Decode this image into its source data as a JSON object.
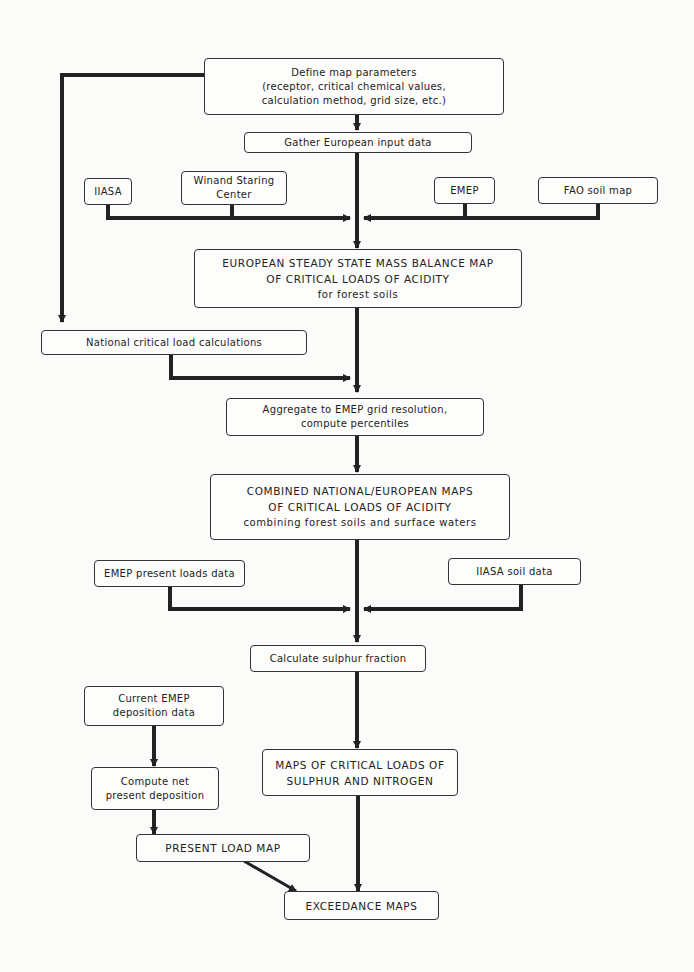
{
  "diagram": {
    "type": "flowchart",
    "nodes": {
      "define": {
        "lines": [
          "Define map parameters",
          "(receptor, critical chemical values,",
          "calculation method, grid size, etc.)"
        ]
      },
      "gather": {
        "lines": [
          "Gather European input data"
        ]
      },
      "iiasa": {
        "lines": [
          "IIASA"
        ]
      },
      "winand": {
        "lines": [
          "Winand Staring",
          "Center"
        ]
      },
      "emep": {
        "lines": [
          "EMEP"
        ]
      },
      "fao": {
        "lines": [
          "FAO soil map"
        ]
      },
      "european": {
        "lines": [
          "EUROPEAN STEADY STATE MASS BALANCE MAP",
          "OF CRITICAL LOADS OF ACIDITY",
          "for forest soils"
        ]
      },
      "national": {
        "lines": [
          "National critical load calculations"
        ]
      },
      "aggregate": {
        "lines": [
          "Aggregate to EMEP grid resolution,",
          "compute percentiles"
        ]
      },
      "combined": {
        "lines": [
          "COMBINED NATIONAL/EUROPEAN MAPS",
          "OF CRITICAL LOADS OF ACIDITY",
          "combining forest soils and surface waters"
        ]
      },
      "emep_present": {
        "lines": [
          "EMEP present loads data"
        ]
      },
      "iiasa_soil": {
        "lines": [
          "IIASA soil data"
        ]
      },
      "sulphur_fraction": {
        "lines": [
          "Calculate sulphur fraction"
        ]
      },
      "current_emep": {
        "lines": [
          "Current EMEP",
          "deposition data"
        ]
      },
      "compute_net": {
        "lines": [
          "Compute net",
          "present deposition"
        ]
      },
      "maps_sn": {
        "lines": [
          "MAPS OF CRITICAL LOADS OF",
          "SULPHUR AND NITROGEN"
        ]
      },
      "present_load": {
        "lines": [
          "PRESENT LOAD MAP"
        ]
      },
      "exceedance": {
        "lines": [
          "EXCEEDANCE MAPS"
        ]
      }
    },
    "edges": [
      [
        "define",
        "gather"
      ],
      [
        "define",
        "national"
      ],
      [
        "gather",
        "european"
      ],
      [
        "iiasa",
        "european"
      ],
      [
        "winand",
        "european"
      ],
      [
        "emep",
        "european"
      ],
      [
        "fao",
        "european"
      ],
      [
        "european",
        "aggregate"
      ],
      [
        "national",
        "aggregate"
      ],
      [
        "aggregate",
        "combined"
      ],
      [
        "combined",
        "sulphur_fraction"
      ],
      [
        "emep_present",
        "sulphur_fraction"
      ],
      [
        "iiasa_soil",
        "sulphur_fraction"
      ],
      [
        "sulphur_fraction",
        "maps_sn"
      ],
      [
        "current_emep",
        "compute_net"
      ],
      [
        "compute_net",
        "present_load"
      ],
      [
        "maps_sn",
        "exceedance"
      ],
      [
        "present_load",
        "exceedance"
      ]
    ],
    "colors": {
      "line": "#222222",
      "box_border": "#333333",
      "background": "#fbfbfa"
    }
  }
}
